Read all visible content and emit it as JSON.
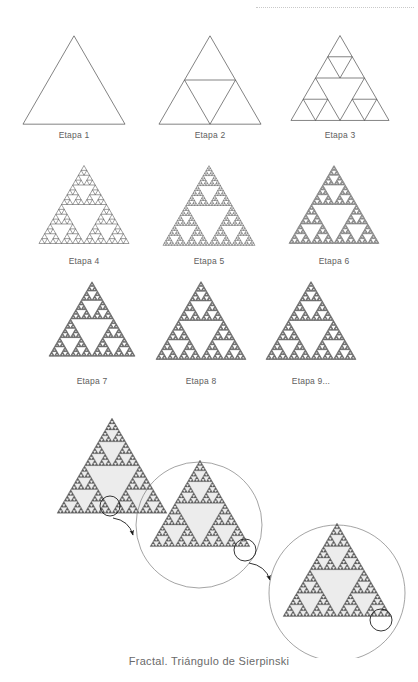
{
  "page": {
    "background_color": "#ffffff",
    "width": 418,
    "height": 682
  },
  "decor": {
    "top_rule_style": "dotted",
    "top_rule_color": "#c9c9c9"
  },
  "caption": {
    "text": "Fractal. Triángulo de Sierpinski"
  },
  "colors": {
    "outline": "#4a4a4a",
    "fill_hole": "#ececec",
    "fill_solid": "#5f5f5f",
    "label": "#5e5e5e",
    "caption": "#6a6a6a",
    "circle_stroke": "#7d7d7d",
    "arrow": "#1a1a1a"
  },
  "stages": {
    "title": "Etapas del Triángulo de Sierpinski",
    "items": [
      {
        "label": "Etapa 1",
        "depth": 0,
        "x": 22,
        "y": 34,
        "size": 104,
        "label_y": 130
      },
      {
        "label": "Etapa 2",
        "depth": 1,
        "x": 158,
        "y": 34,
        "size": 104,
        "label_y": 130
      },
      {
        "label": "Etapa 3",
        "depth": 2,
        "x": 290,
        "y": 34,
        "size": 100,
        "label_y": 130
      },
      {
        "label": "Etapa 4",
        "depth": 4,
        "x": 38,
        "y": 164,
        "size": 92,
        "label_y": 256
      },
      {
        "label": "Etapa 5",
        "depth": 5,
        "x": 162,
        "y": 164,
        "size": 94,
        "label_y": 256
      },
      {
        "label": "Etapa 6",
        "depth": 6,
        "x": 288,
        "y": 164,
        "size": 92,
        "label_y": 256
      },
      {
        "label": "Etapa 7",
        "depth": 7,
        "x": 48,
        "y": 280,
        "size": 88,
        "label_y": 376
      },
      {
        "label": "Etapa 8",
        "depth": 7,
        "x": 155,
        "y": 280,
        "size": 92,
        "label_y": 376
      },
      {
        "label": "Etapa 9...",
        "depth": 7,
        "x": 265,
        "y": 280,
        "size": 92,
        "label_y": 376
      }
    ]
  },
  "zoom_sequence": {
    "description": "Secuencia de ampliación que muestra la autosemejanza del fractal",
    "panels": [
      {
        "name": "panel-1",
        "triangle": {
          "cx": 57,
          "cy": 10,
          "size": 110,
          "depth": 5
        },
        "marker_circle": {
          "cx": 110,
          "cy": 98,
          "r": 10
        },
        "magnifier_circle": null,
        "arrow": {
          "x1": 113,
          "y1": 110,
          "x2": 133,
          "y2": 127
        }
      },
      {
        "name": "panel-2",
        "triangle": {
          "cx": 150,
          "cy": 52,
          "size": 100,
          "depth": 5
        },
        "marker_circle": {
          "cx": 245,
          "cy": 142,
          "r": 11
        },
        "magnifier_circle": {
          "cx": 199,
          "cy": 117,
          "r": 63
        },
        "arrow": {
          "x1": 249,
          "y1": 155,
          "x2": 270,
          "y2": 172
        }
      },
      {
        "name": "panel-3",
        "triangle": {
          "cx": 283,
          "cy": 115,
          "size": 108,
          "depth": 5
        },
        "marker_circle": {
          "cx": 381,
          "cy": 212,
          "r": 11
        },
        "magnifier_circle": {
          "cx": 337,
          "cy": 185,
          "r": 68
        },
        "arrow": null
      }
    ]
  }
}
